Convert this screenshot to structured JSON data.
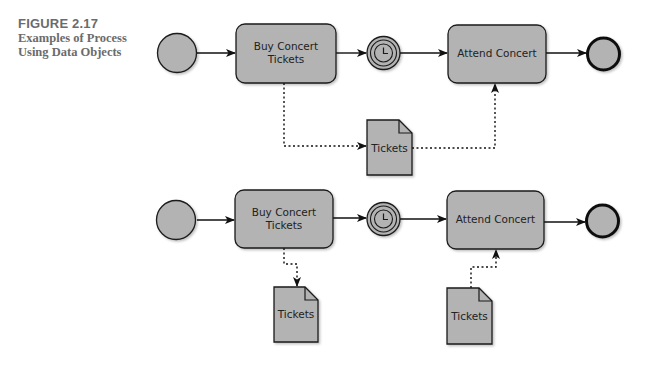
{
  "caption": {
    "figure_number": "FIGURE 2.17",
    "title_line1": "Examples of Process",
    "title_line2": "Using Data Objects"
  },
  "colors": {
    "shape_fill": "#b3b3b3",
    "stroke": "#1a1a1a",
    "caption_text": "#6b6b6b"
  },
  "diagram1": {
    "start_event": "start-event",
    "task1": {
      "line1": "Buy Concert",
      "line2": "Tickets"
    },
    "timer_event": "timer-intermediate-event",
    "task2": {
      "label": "Attend Concert"
    },
    "end_event": "end-event",
    "data_object": {
      "label": "Tickets"
    }
  },
  "diagram2": {
    "start_event": "start-event",
    "task1": {
      "line1": "Buy Concert",
      "line2": "Tickets"
    },
    "timer_event": "timer-intermediate-event",
    "task2": {
      "label": "Attend Concert"
    },
    "end_event": "end-event",
    "data_object_output": {
      "label": "Tickets"
    },
    "data_object_input": {
      "label": "Tickets"
    }
  }
}
